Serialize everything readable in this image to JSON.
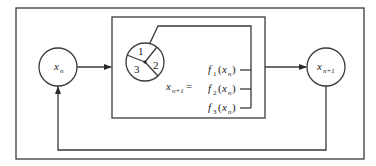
{
  "diagram": {
    "type": "iterated-function-system-flow",
    "input_node": {
      "var": "x",
      "sub": "n"
    },
    "output_node": {
      "var": "x",
      "sub": "n+1"
    },
    "selector": {
      "description": "random selector wheel",
      "sectors": [
        "1",
        "2",
        "3"
      ]
    },
    "equation_lhs": {
      "var": "x",
      "sub": "n+1",
      "eq": "="
    },
    "functions": [
      {
        "name": "f",
        "index": "1",
        "arg_var": "x",
        "arg_sub": "n"
      },
      {
        "name": "f",
        "index": "2",
        "arg_var": "x",
        "arg_sub": "n"
      },
      {
        "name": "f",
        "index": "3",
        "arg_var": "x",
        "arg_sub": "n"
      }
    ],
    "feedback": "output x_{n+1} loops back as input x_n"
  }
}
